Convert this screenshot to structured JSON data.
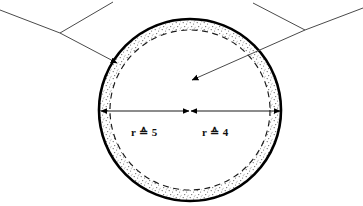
{
  "figure": {
    "background_color": "#ffffff",
    "ink_color": "#000000",
    "stipple_color": "#6b6b6b",
    "leader_line_color": "#4a4a4a"
  },
  "labels": {
    "left_radius": "r ≙ 5",
    "right_radius": "r ≙ 4"
  },
  "geometry": {
    "center_x": 190,
    "center_y": 110,
    "outer_radius": 91,
    "inner_radius": 80,
    "dimension_line_y": 111,
    "dimension_left_x": 100,
    "dimension_mid_x": 190,
    "dimension_right_x": 281
  },
  "annotations": {
    "left_leader_junction_x": 60,
    "left_leader_junction_y": 33,
    "right_leader_junction_x": 305,
    "right_leader_junction_y": 30,
    "shell_arrow_target_x": 117,
    "shell_arrow_target_y": 63,
    "core_arrow_target_x": 192,
    "core_arrow_target_y": 80
  }
}
